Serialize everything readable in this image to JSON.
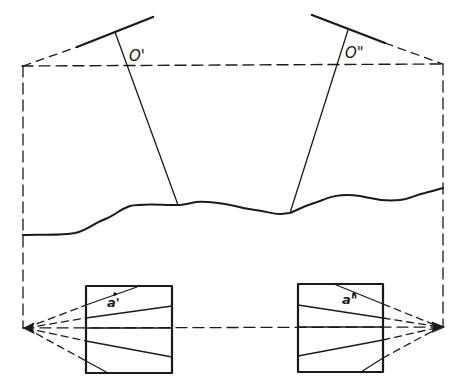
{
  "diagram": {
    "type": "stereo photogrammetry geometry sketch",
    "colors": {
      "line": "#1a1a1a",
      "background": "#ffffff"
    },
    "labels": {
      "left_projection_center": "O'",
      "right_projection_center": "O\"",
      "left_image_point": "a'",
      "right_image_point": "a\""
    },
    "elements": {
      "baseline": "dashed horizontal line connecting projection centers",
      "left_photo_plane": "tilted solid line top-left",
      "right_photo_plane": "tilted solid line top-right",
      "terrain": "wavy solid ground profile",
      "left_plan_frame": "square frame bottom-left with radiating lines",
      "right_plan_frame": "square frame bottom-right with radiating lines"
    }
  }
}
